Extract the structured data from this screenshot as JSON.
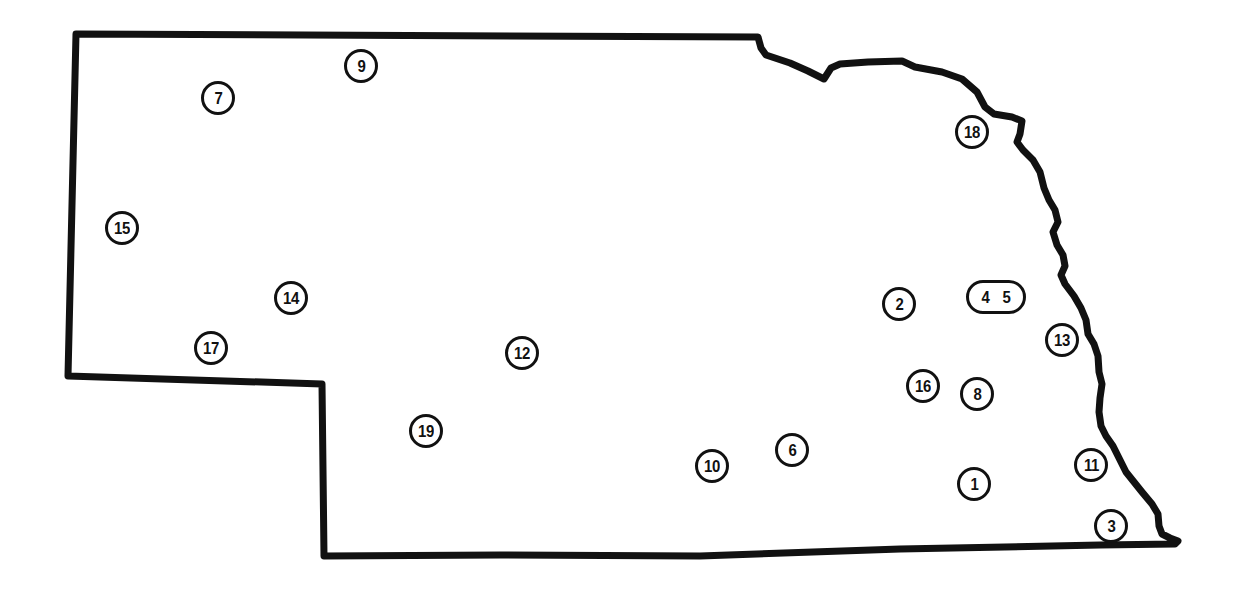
{
  "map": {
    "title": "Nebraska",
    "outline_color": "#111111",
    "background_color": "#ffffff",
    "markers": [
      {
        "id": "1",
        "label": "1",
        "x": 974,
        "y": 484
      },
      {
        "id": "2",
        "label": "2",
        "x": 899,
        "y": 304
      },
      {
        "id": "3",
        "label": "3",
        "x": 1111,
        "y": 526
      },
      {
        "id": "4",
        "label": "4",
        "x": 978,
        "y": 297
      },
      {
        "id": "5",
        "label": "5",
        "x": 1014,
        "y": 297
      },
      {
        "id": "6",
        "label": "6",
        "x": 792,
        "y": 450
      },
      {
        "id": "7",
        "label": "7",
        "x": 218,
        "y": 98
      },
      {
        "id": "8",
        "label": "8",
        "x": 977,
        "y": 394
      },
      {
        "id": "9",
        "label": "9",
        "x": 361,
        "y": 66
      },
      {
        "id": "10",
        "label": "10",
        "x": 712,
        "y": 466
      },
      {
        "id": "11",
        "label": "11",
        "x": 1091,
        "y": 465
      },
      {
        "id": "12",
        "label": "12",
        "x": 522,
        "y": 353
      },
      {
        "id": "13",
        "label": "13",
        "x": 1062,
        "y": 340
      },
      {
        "id": "14",
        "label": "14",
        "x": 291,
        "y": 298
      },
      {
        "id": "15",
        "label": "15",
        "x": 122,
        "y": 228
      },
      {
        "id": "16",
        "label": "16",
        "x": 923,
        "y": 386
      },
      {
        "id": "17",
        "label": "17",
        "x": 211,
        "y": 348
      },
      {
        "id": "18",
        "label": "18",
        "x": 972,
        "y": 132
      },
      {
        "id": "19",
        "label": "19",
        "x": 426,
        "y": 431
      }
    ]
  }
}
